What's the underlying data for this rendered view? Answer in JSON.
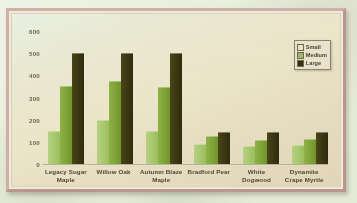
{
  "chart_data": {
    "type": "bar",
    "title": "",
    "xlabel": "",
    "ylabel": "",
    "ylim": [
      0,
      600
    ],
    "yticks": [
      600,
      500,
      400,
      300,
      200,
      100,
      0
    ],
    "grid": false,
    "legend_position": "top-right",
    "categories": [
      "Legacy Sugar Maple",
      "Willow Oak",
      "Autumn Blaze Maple",
      "Bradford Pear",
      "White Dogwood",
      "Dynamite Crape Myrtle"
    ],
    "series": [
      {
        "name": "Small",
        "color": "#a8c86d",
        "values": [
          150,
          200,
          150,
          90,
          80,
          85
        ]
      },
      {
        "name": "Medium",
        "color": "#7fa336",
        "values": [
          350,
          375,
          348,
          125,
          110,
          115
        ]
      },
      {
        "name": "Large",
        "color": "#3b3611",
        "values": [
          500,
          500,
          500,
          145,
          145,
          145
        ]
      }
    ]
  },
  "legend": {
    "entries": [
      {
        "label": "Small"
      },
      {
        "label": "Medium"
      },
      {
        "label": "Large"
      }
    ]
  },
  "axis": {
    "y": {
      "ticks": [
        "600",
        "500",
        "400",
        "300",
        "200",
        "100",
        "0"
      ]
    }
  },
  "categories_display": [
    "Legacy Sugar Maple",
    "Willow Oak",
    "Autumn Blaze Maple",
    "Bradford Pear",
    "White Dogwood",
    "Dynamite Crape Myrtle"
  ],
  "colors": {
    "small": "#a8c86d",
    "medium": "#7fa336",
    "large": "#3b3611",
    "frame": "#c8a9a0",
    "plot_background": "#eae7cd",
    "page_background": "#eef2e4",
    "axis_text": "#6d6450",
    "label_text": "#4e4636"
  }
}
